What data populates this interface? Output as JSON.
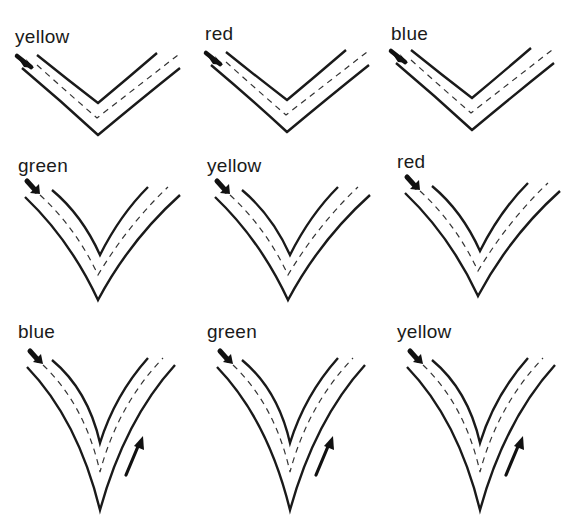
{
  "figure": {
    "type": "road-junction-grid",
    "rows": 3,
    "cols": 3,
    "colors": {
      "line": "#1a1a1a",
      "dash": "#333333",
      "background": "#ffffff"
    }
  },
  "panels": [
    {
      "label": "yellow",
      "row": 1,
      "col": 1,
      "shape": "wide-v",
      "return_arrow": false
    },
    {
      "label": "red",
      "row": 1,
      "col": 2,
      "shape": "wide-v",
      "return_arrow": false
    },
    {
      "label": "blue",
      "row": 1,
      "col": 3,
      "shape": "wide-v",
      "return_arrow": false
    },
    {
      "label": "green",
      "row": 2,
      "col": 1,
      "shape": "medium-v",
      "return_arrow": false
    },
    {
      "label": "yellow",
      "row": 2,
      "col": 2,
      "shape": "medium-v",
      "return_arrow": false
    },
    {
      "label": "red",
      "row": 2,
      "col": 3,
      "shape": "medium-v",
      "return_arrow": false
    },
    {
      "label": "blue",
      "row": 3,
      "col": 1,
      "shape": "narrow-v",
      "return_arrow": true
    },
    {
      "label": "green",
      "row": 3,
      "col": 2,
      "shape": "narrow-v",
      "return_arrow": true
    },
    {
      "label": "yellow",
      "row": 3,
      "col": 3,
      "shape": "narrow-v",
      "return_arrow": true
    }
  ]
}
